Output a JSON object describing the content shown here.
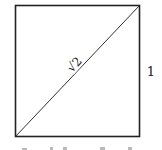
{
  "diagram": {
    "diagonal_label": "√2",
    "side_label": "1",
    "caption_partial": ""
  }
}
